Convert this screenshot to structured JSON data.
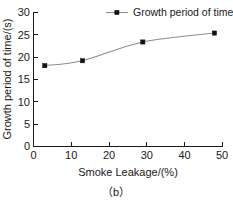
{
  "chart_data": {
    "type": "line",
    "title": "",
    "subtitle": "",
    "caption": "（b）",
    "xlabel": "Smoke Leakage/(%)",
    "ylabel": "Growth period of time/(s)",
    "xlim": [
      0,
      50
    ],
    "ylim": [
      0,
      30
    ],
    "xticks": [
      "0",
      "10",
      "20",
      "30",
      "40",
      "50"
    ],
    "xtick_values": [
      0,
      10,
      20,
      30,
      40,
      50
    ],
    "yticks": [
      "0",
      "5",
      "10",
      "15",
      "20",
      "25",
      "30"
    ],
    "ytick_values": [
      0,
      5,
      10,
      15,
      20,
      25,
      30
    ],
    "grid": false,
    "legend_position": "top-right",
    "marker": "filled-square",
    "line_color": "#8c8c8c",
    "marker_color": "#111111",
    "series": [
      {
        "name": "Growth period of time",
        "x": [
          3,
          13,
          29,
          48
        ],
        "values": [
          18.1,
          19.2,
          23.4,
          25.4
        ]
      }
    ]
  },
  "legend": {
    "entries": [
      {
        "label": "Growth period of time",
        "marker": "filled-square",
        "color": "#111111"
      }
    ]
  },
  "axes": {
    "x_title": "Smoke Leakage/(%)",
    "y_title": "Growth period of time/(s)"
  },
  "caption": {
    "text": "（b）"
  }
}
